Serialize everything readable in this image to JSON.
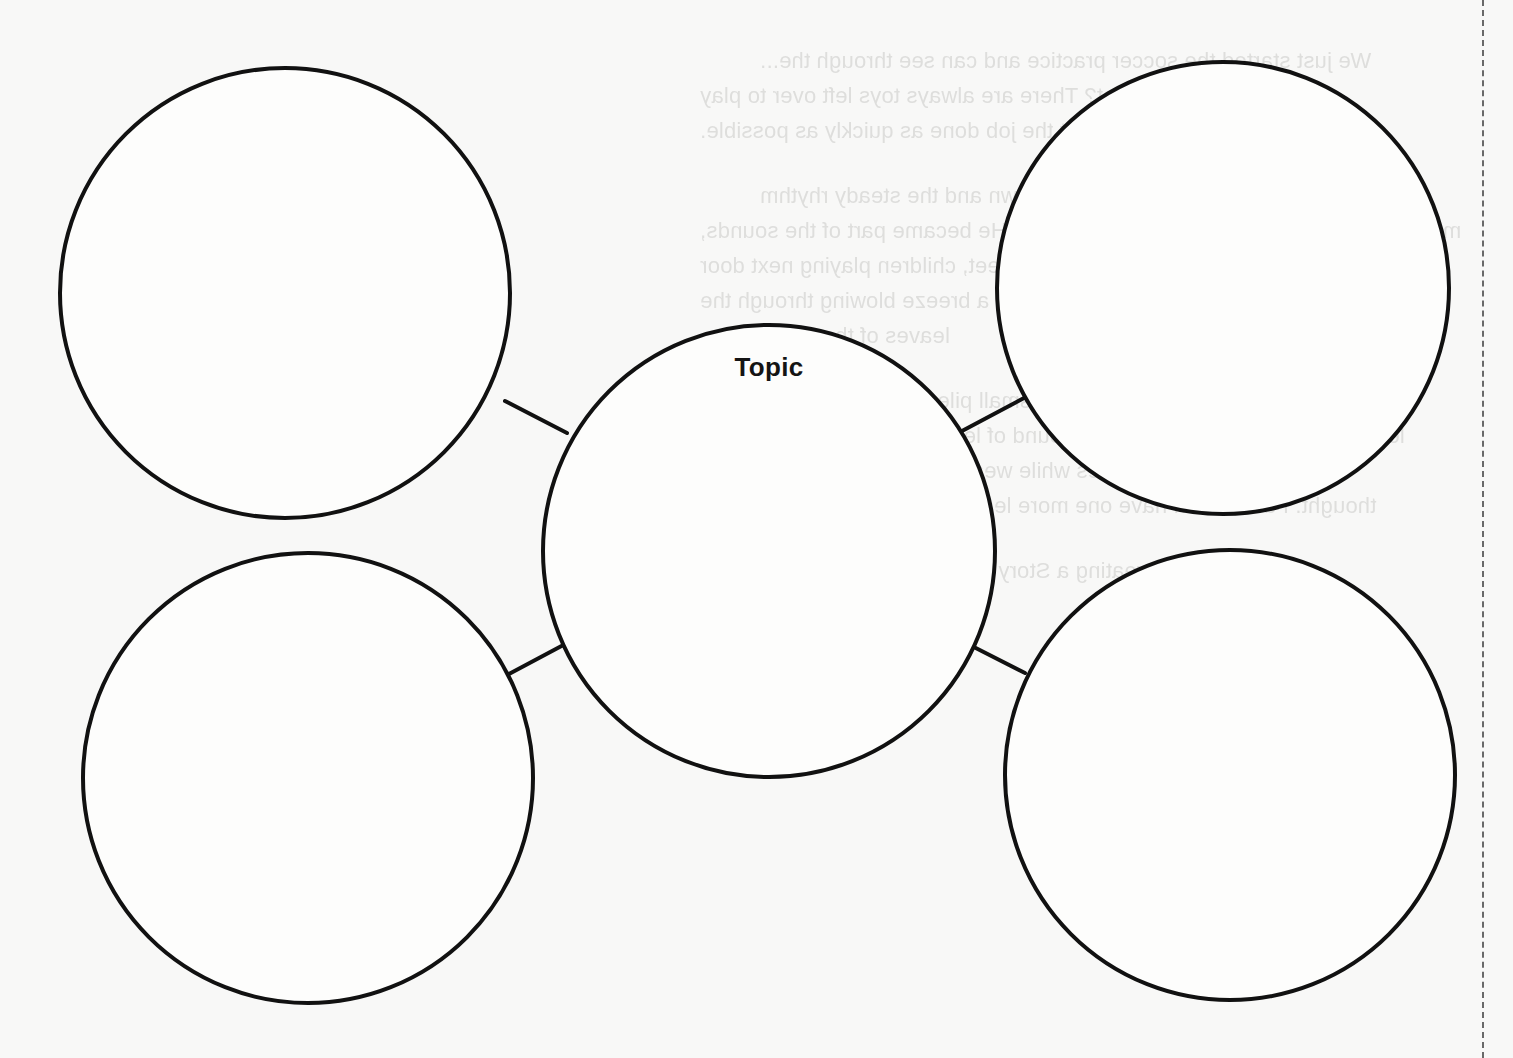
{
  "diagram": {
    "type": "story-web",
    "center": {
      "label": "Topic",
      "cx": 769,
      "cy": 551,
      "r": 226
    },
    "branches": [
      {
        "id": "top-left",
        "label": "",
        "cx": 285,
        "cy": 293,
        "r": 225,
        "connector": [
          505,
          401,
          567,
          433
        ]
      },
      {
        "id": "top-right",
        "label": "",
        "cx": 1223,
        "cy": 288,
        "r": 226,
        "connector": [
          962,
          431,
          1024,
          398
        ]
      },
      {
        "id": "bottom-left",
        "label": "",
        "cx": 308,
        "cy": 778,
        "r": 225,
        "connector": [
          505,
          676,
          569,
          642
        ]
      },
      {
        "id": "bottom-right",
        "label": "",
        "cx": 1230,
        "cy": 775,
        "r": 225,
        "connector": [
          962,
          641,
          1025,
          673
        ]
      }
    ],
    "stroke_color": "#111111",
    "stroke_width": 4
  },
  "bleed_through_text": [
    {
      "x": 760,
      "y": 60,
      "text": "We just started the soccer practice and can see through the..."
    },
    {
      "x": 700,
      "y": 95,
      "text": "on my left. And why not? There are always toys left over to play"
    },
    {
      "x": 700,
      "y": 130,
      "text": "outside. We decided to get the job done as quickly as possible."
    },
    {
      "x": 760,
      "y": 195,
      "text": "So, the sound of the rake sweeping the lawn and the steady rhythm"
    },
    {
      "x": 700,
      "y": 230,
      "text": "movement of his arms calmed Michael down. He became part of the sounds,"
    },
    {
      "x": 700,
      "y": 265,
      "text": "for instance. He noticed cars on the street, children playing next door"
    },
    {
      "x": 700,
      "y": 300,
      "text": "and birds singing. He became aware of a breeze blowing through the"
    },
    {
      "x": 760,
      "y": 335,
      "text": "leaves of the trees."
    },
    {
      "x": 760,
      "y": 400,
      "text": "Then he spotted the harvest, each small pile grown into a bold"
    },
    {
      "x": 700,
      "y": 435,
      "text": "leaves. He watched the growing mound of leaves and suddenly felt like"
    },
    {
      "x": 700,
      "y": 470,
      "text": "jumping in a pile of leaves while wearing his clothes after all this"
    },
    {
      "x": 700,
      "y": 505,
      "text": "thought. I don't even have one more leaf in the tree, so I just looked!"
    },
    {
      "x": 700,
      "y": 570,
      "text": "Complete the Creating a Story Web Worksheet for this story."
    }
  ],
  "cut_line": {
    "x": 1482,
    "style": "dashed"
  }
}
